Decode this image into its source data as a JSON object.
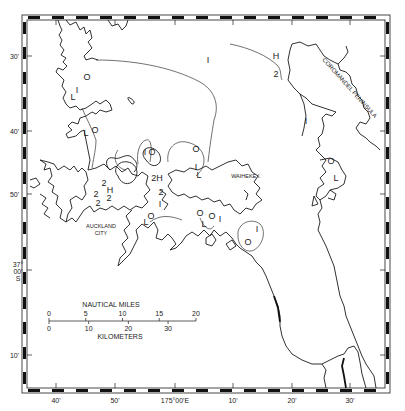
{
  "map": {
    "region": "Hauraki Gulf",
    "place_labels": [
      {
        "id": "coromandel",
        "text": "COROMANDEL PENINSULA",
        "x": 322,
        "y": 60,
        "rotate": 48,
        "size": 6
      },
      {
        "id": "waiheke",
        "text": "WAIHEKE I.",
        "x": 246,
        "y": 178,
        "rotate": 0,
        "size": 5.5
      },
      {
        "id": "auckland1",
        "text": "AUCKLAND",
        "x": 101,
        "y": 228,
        "rotate": 0,
        "size": 5.5
      },
      {
        "id": "auckland2",
        "text": "CITY",
        "x": 101,
        "y": 235,
        "rotate": 0,
        "size": 5.5
      }
    ],
    "contour_labels": [
      {
        "text": "O",
        "x": 87,
        "y": 80
      },
      {
        "text": "I",
        "x": 77,
        "y": 93
      },
      {
        "text": "L",
        "x": 73,
        "y": 100
      },
      {
        "text": "L",
        "x": 86,
        "y": 136
      },
      {
        "text": "O",
        "x": 95,
        "y": 133
      },
      {
        "text": "I",
        "x": 145,
        "y": 155
      },
      {
        "text": "O",
        "x": 152,
        "y": 155
      },
      {
        "text": "O",
        "x": 196,
        "y": 152
      },
      {
        "text": "I",
        "x": 208,
        "y": 63
      },
      {
        "text": "H",
        "x": 276,
        "y": 59
      },
      {
        "text": "2",
        "x": 276,
        "y": 77
      },
      {
        "text": "I",
        "x": 306,
        "y": 124
      },
      {
        "text": "O",
        "x": 331,
        "y": 164
      },
      {
        "text": "L",
        "x": 336,
        "y": 181
      },
      {
        "text": "2",
        "x": 104,
        "y": 186
      },
      {
        "text": "H",
        "x": 110,
        "y": 193
      },
      {
        "text": "2",
        "x": 109,
        "y": 201
      },
      {
        "text": "2",
        "x": 96,
        "y": 197
      },
      {
        "text": "2",
        "x": 98,
        "y": 206
      },
      {
        "text": "2H",
        "x": 157,
        "y": 181
      },
      {
        "text": "2",
        "x": 161,
        "y": 195
      },
      {
        "text": "I",
        "x": 160,
        "y": 207
      },
      {
        "text": "I",
        "x": 196,
        "y": 170
      },
      {
        "text": "L",
        "x": 199,
        "y": 178
      },
      {
        "text": "L",
        "x": 146,
        "y": 225
      },
      {
        "text": "O",
        "x": 151,
        "y": 219
      },
      {
        "text": "O",
        "x": 200,
        "y": 216
      },
      {
        "text": "O",
        "x": 212,
        "y": 219
      },
      {
        "text": "L",
        "x": 204,
        "y": 227
      },
      {
        "text": "I",
        "x": 220,
        "y": 222
      },
      {
        "text": "O",
        "x": 248,
        "y": 245
      },
      {
        "text": "I",
        "x": 257,
        "y": 232
      }
    ]
  },
  "frame": {
    "lat_labels": [
      {
        "text": "30'",
        "y": 59
      },
      {
        "text": "40'",
        "y": 134
      },
      {
        "text": "50'",
        "y": 197
      },
      {
        "text": "10'",
        "y": 358
      }
    ],
    "lat_main": {
      "line1": "37°",
      "line2": "00'",
      "line3": "S",
      "y": 273
    },
    "lon_labels": [
      {
        "text": "40'",
        "x": 56
      },
      {
        "text": "50'",
        "x": 115
      },
      {
        "text": "175°00'E",
        "x": 175
      },
      {
        "text": "10'",
        "x": 233
      },
      {
        "text": "20'",
        "x": 292
      },
      {
        "text": "30'",
        "x": 350
      }
    ]
  },
  "scale_bar": {
    "title_top": "NAUTICAL MILES",
    "title_bottom": "KILOMETERS",
    "nautical_miles": [
      "0",
      "5",
      "10",
      "15",
      "20"
    ],
    "kilometers": [
      "0",
      "10",
      "20",
      "30"
    ]
  },
  "colors": {
    "ink": "#1a1a1a",
    "paper": "#ffffff"
  }
}
